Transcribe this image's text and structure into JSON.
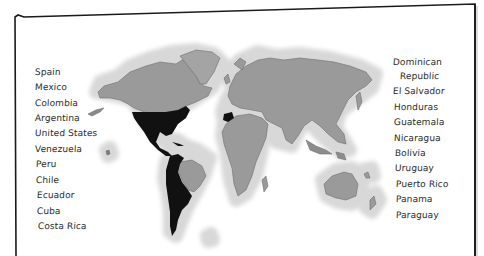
{
  "figure": {
    "type": "world-map-worksheet",
    "highlight_color": "#111111",
    "land_color": "#9a9a9a",
    "halo_color": "#d6d6d6",
    "highlighted_regions": [
      "Spain",
      "United States",
      "Mexico",
      "Central America",
      "Caribbean",
      "South America (Spanish-speaking)"
    ]
  },
  "left_list": {
    "items": [
      {
        "label": "Spain"
      },
      {
        "label": "Mexico"
      },
      {
        "label": "Colombia"
      },
      {
        "label": "Argentina"
      },
      {
        "label": "United States"
      },
      {
        "label": "Venezuela"
      },
      {
        "label": "Peru"
      },
      {
        "label": "Chile"
      },
      {
        "label": "Ecuador"
      },
      {
        "label": "Cuba"
      },
      {
        "label": "Costa Rica"
      }
    ]
  },
  "right_list": {
    "items": [
      {
        "label": "Dominican"
      },
      {
        "label": "Republic"
      },
      {
        "label": "El Salvador"
      },
      {
        "label": "Honduras"
      },
      {
        "label": "Guatemala"
      },
      {
        "label": "Nicaragua"
      },
      {
        "label": "Bolivia"
      },
      {
        "label": "Uruguay"
      },
      {
        "label": "Puerto Rico"
      },
      {
        "label": "Panama"
      },
      {
        "label": "Paraguay"
      }
    ]
  }
}
